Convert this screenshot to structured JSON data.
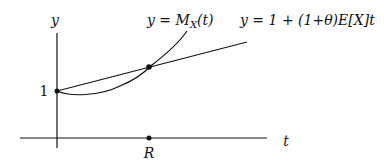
{
  "diagram": {
    "axis_labels": {
      "y": "y",
      "t": "t"
    },
    "y_intercept_label": "1",
    "intersection_label": "R",
    "curves": [
      {
        "name": "mgf-curve",
        "label": "y = M_X(t)",
        "label_main": "y = M",
        "label_sub": "X",
        "label_tail": "(t)"
      },
      {
        "name": "line",
        "label": "y = 1 + (1+θ)E[X]t"
      }
    ],
    "points": [
      {
        "name": "y-intercept-point",
        "description": "(0, 1)"
      },
      {
        "name": "intersection-point",
        "description": "intersection at t = R"
      },
      {
        "name": "r-point",
        "description": "R on t-axis"
      }
    ],
    "colors": {
      "stroke": "#111111",
      "background": "#ffffff"
    }
  }
}
